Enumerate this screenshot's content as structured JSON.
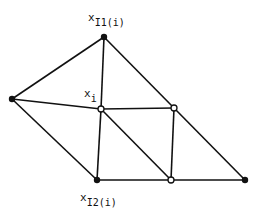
{
  "diagram": {
    "type": "triangulated mesh",
    "colors": {
      "line": "#111111",
      "filled_node": "#111111",
      "open_node_fill": "#ffffff"
    },
    "nodes": [
      {
        "id": "top",
        "x": 104,
        "y": 37,
        "style": "filled"
      },
      {
        "id": "left",
        "x": 12,
        "y": 99,
        "style": "filled"
      },
      {
        "id": "center",
        "x": 101,
        "y": 109,
        "style": "open"
      },
      {
        "id": "right_mid",
        "x": 174,
        "y": 108,
        "style": "open"
      },
      {
        "id": "bottom_left",
        "x": 97,
        "y": 180,
        "style": "filled"
      },
      {
        "id": "bottom_mid",
        "x": 171,
        "y": 180,
        "style": "open"
      },
      {
        "id": "bottom_right",
        "x": 245,
        "y": 180,
        "style": "filled"
      }
    ],
    "edges": [
      [
        "top",
        "left"
      ],
      [
        "top",
        "center"
      ],
      [
        "top",
        "right_mid"
      ],
      [
        "right_mid",
        "bottom_right"
      ],
      [
        "left",
        "center"
      ],
      [
        "center",
        "right_mid"
      ],
      [
        "left",
        "bottom_left"
      ],
      [
        "center",
        "bottom_left"
      ],
      [
        "center",
        "bottom_mid"
      ],
      [
        "right_mid",
        "bottom_mid"
      ],
      [
        "bottom_left",
        "bottom_mid"
      ],
      [
        "bottom_mid",
        "bottom_right"
      ]
    ],
    "labels": {
      "top": {
        "main": "x",
        "sub": "I1(i)"
      },
      "center": {
        "main": "x",
        "sub": "i"
      },
      "bottom": {
        "main": "x",
        "sub": "I2(i)"
      }
    }
  }
}
